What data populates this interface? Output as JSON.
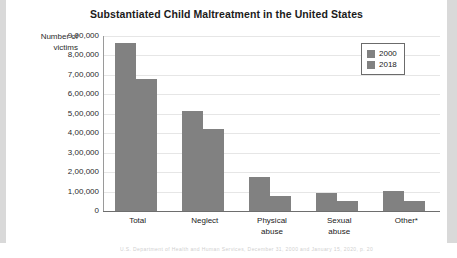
{
  "chart_data": {
    "type": "bar",
    "title": "Substantiated Child Maltreatment in the United States",
    "xlabel": "",
    "ylabel": "Number of victims",
    "categories": [
      "Total",
      "Neglect",
      "Physical abuse",
      "Sexual abuse",
      "Other*"
    ],
    "category_lines": [
      [
        "Total"
      ],
      [
        "Neglect"
      ],
      [
        "Physical",
        "abuse"
      ],
      [
        "Sexual",
        "abuse"
      ],
      [
        "Other*"
      ]
    ],
    "series": [
      {
        "name": "2000",
        "values": [
          862000,
          512000,
          175000,
          93000,
          102000
        ]
      },
      {
        "name": "2018",
        "values": [
          679000,
          420000,
          78000,
          53000,
          50000
        ]
      }
    ],
    "ylim": [
      0,
      900000
    ],
    "ytick_values": [
      900000,
      800000,
      700000,
      600000,
      500000,
      400000,
      300000,
      200000,
      100000,
      0
    ],
    "ytick_labels": [
      "9,00,000",
      "8,00,000",
      "7,00,000",
      "6,00,000",
      "5,00,000",
      "4,00,000",
      "3,00,000",
      "2,00,000",
      "1,00,000",
      "0"
    ],
    "grid": true,
    "legend_position": "top-right",
    "colors": {
      "bar": "#818181",
      "gridline": "#e6e6e6",
      "axis": "#6e6e6e",
      "text": "#222222"
    }
  },
  "page": {
    "footnote": "U.S. Department of Health and Human Services, December 31, 2000 and January 15, 2020, p. 20"
  }
}
